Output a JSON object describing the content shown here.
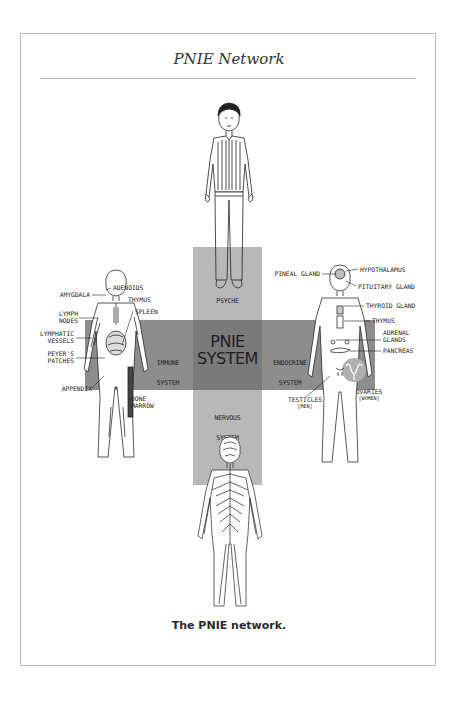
{
  "page": {
    "title": "PNIE Network",
    "caption": "The PNIE network."
  },
  "diagram": {
    "center": {
      "line1": "PNIE",
      "line2": "SYSTEM"
    },
    "nodes": {
      "psyche": "PSYCHE",
      "immune": {
        "line1": "IMMUNE",
        "line2": "SYSTEM"
      },
      "endocrine": {
        "line1": "ENDOCRINE",
        "line2": "SYSTEM"
      },
      "nervous": {
        "line1": "NERVOUS",
        "line2": "SYSTEM"
      }
    },
    "immune_labels": {
      "adenoids": "ADENOIDS",
      "amygdala": "AMYGDALA",
      "thymus": "THYMUS",
      "spleen": "SPLEEN",
      "lymph_nodes_1": "LYMPH",
      "lymph_nodes_2": "NODES",
      "lymphatic_vessels_1": "LYMPHATIC",
      "lymphatic_vessels_2": "VESSELS",
      "peyers_patches_1": "PEYER'S",
      "peyers_patches_2": "PATCHES",
      "appendix": "APPENDIX",
      "bone_marrow_1": "BONE",
      "bone_marrow_2": "MARROW"
    },
    "endocrine_labels": {
      "pineal_gland": "PINEAL GLAND",
      "hypothalamus": "HYPOTHALAMUS",
      "pituitary_gland": "PITUITARY GLAND",
      "thyroid_gland": "THYROID GLAND",
      "thymus": "THYMUS",
      "adrenal_glands_1": "ADRENAL",
      "adrenal_glands_2": "GLANDS",
      "pancreas": "PANCREAS",
      "testicles": "TESTICLES",
      "testicles_note": "[MEN]",
      "ovaries": "OVARIES",
      "ovaries_note": "[WOMEN]"
    },
    "colors": {
      "vertical_bar": "#b8b8b8",
      "horizontal_bar": "#8d8d8d",
      "center_square": "#7a7a7a",
      "frame": "#bdbdbd"
    }
  }
}
